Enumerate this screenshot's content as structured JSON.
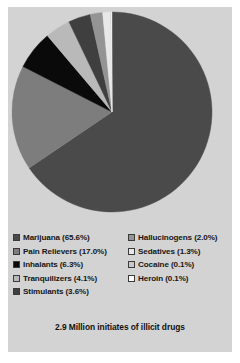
{
  "card": {
    "background_color": "#d3d3d3",
    "page_background_color": "#ffffff"
  },
  "caption": {
    "text": "2.9 Million initiates of illicit drugs"
  },
  "legend": {
    "left_column": [
      {
        "label": "Marijuana (65.6%)",
        "color": "#4a4a4a"
      },
      {
        "label": "Pain Relievers (17.0%)",
        "color": "#7d7d7d"
      },
      {
        "label": "Inhalants (6.3%)",
        "color": "#0a0a0a"
      },
      {
        "label": "Tranquilizers (4.1%)",
        "color": "#b9b9b9"
      },
      {
        "label": "Stimulants (3.6%)",
        "color": "#3f3f3f"
      }
    ],
    "right_column": [
      {
        "label": "Hallucinogens (2.0%)",
        "color": "#949494"
      },
      {
        "label": "Sedatives (1.3%)",
        "color": "#e8e8e8"
      },
      {
        "label": "Cocaine (0.1%)",
        "color": "#c9c9c9"
      },
      {
        "label": "Heroin (0.1%)",
        "color": "#fcfcfc"
      }
    ]
  },
  "chart_data": {
    "type": "pie",
    "title": "2.9 Million initiates of illicit drugs",
    "xlabel": "",
    "ylabel": "",
    "legend_position": "bottom",
    "grid": false,
    "units": "percent",
    "start_angle_deg": 0,
    "direction": "clockwise",
    "categories": [
      "Marijuana",
      "Pain Relievers",
      "Inhalants",
      "Tranquilizers",
      "Stimulants",
      "Hallucinogens",
      "Sedatives",
      "Cocaine",
      "Heroin"
    ],
    "values": [
      65.6,
      17.0,
      6.3,
      4.1,
      3.6,
      2.0,
      1.3,
      0.1,
      0.1
    ],
    "colors": [
      "#4a4a4a",
      "#7d7d7d",
      "#0a0a0a",
      "#b9b9b9",
      "#3f3f3f",
      "#949494",
      "#e8e8e8",
      "#c9c9c9",
      "#fcfcfc"
    ],
    "slice_labels": [
      "Marijuana (65.6%)",
      "Pain Relievers (17.0%)",
      "Inhalants (6.3%)",
      "Tranquilizers (4.1%)",
      "Stimulants (3.6%)",
      "Hallucinogens (2.0%)",
      "Sedatives (1.3%)",
      "Cocaine (0.1%)",
      "Heroin (0.1%)"
    ]
  }
}
